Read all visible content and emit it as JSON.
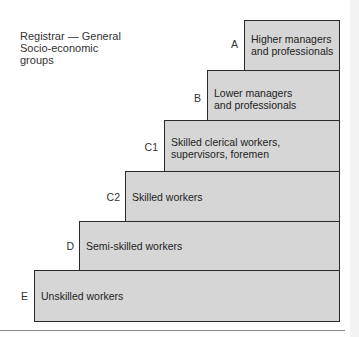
{
  "title": {
    "line1": "Registrar — General",
    "line2": "Socio-economic",
    "line3": "groups"
  },
  "steps": [
    {
      "code": "A",
      "line1": "Higher managers",
      "line2": "and professionals"
    },
    {
      "code": "B",
      "line1": "Lower managers",
      "line2": "and professionals"
    },
    {
      "code": "C1",
      "line1": "Skilled clerical workers,",
      "line2": "supervisors, foremen"
    },
    {
      "code": "C2",
      "line1": "Skilled workers",
      "line2": ""
    },
    {
      "code": "D",
      "line1": "Semi-skilled workers",
      "line2": ""
    },
    {
      "code": "E",
      "line1": "Unskilled workers",
      "line2": ""
    }
  ],
  "colors": {
    "fill": "#d6d6d6",
    "border": "#2a2a2a"
  }
}
